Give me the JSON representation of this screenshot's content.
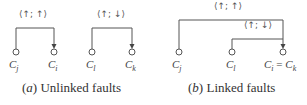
{
  "panels": [
    {
      "caption_letter": "a",
      "caption_text": "Unlinked faults",
      "groups": [
        {
          "tag": "⟨↑; ↑⟩",
          "from": "C_j",
          "to": "C_i"
        },
        {
          "tag": "⟨↑; ↓⟩",
          "from": "C_l",
          "to": "C_k"
        }
      ]
    },
    {
      "caption_letter": "b",
      "caption_text": "Linked faults",
      "groups": [
        {
          "tag": "⟨↑; ↑⟩",
          "from": "C_j",
          "to": "C_i = C_k"
        },
        {
          "tag": "⟨↑; ↓⟩",
          "from": "C_l",
          "to": "C_i = C_k"
        }
      ]
    }
  ],
  "labels": {
    "a_j": "C",
    "a_j_sub": "j",
    "a_i": "C",
    "a_i_sub": "i",
    "a_l": "C",
    "a_l_sub": "l",
    "a_k": "C",
    "a_k_sub": "k",
    "b_j": "C",
    "b_j_sub": "j",
    "b_l": "C",
    "b_l_sub": "l",
    "b_ik_1": "C",
    "b_ik_1_sub": "i",
    "b_ik_eq": " = ",
    "b_ik_2": "C",
    "b_ik_2_sub": "k"
  },
  "tags": {
    "a1": "⟨↑; ↑⟩",
    "a2": "⟨↑; ↓⟩",
    "b1": "⟨↑; ↑⟩",
    "b2": "⟨↑; ↓⟩"
  },
  "captions": {
    "a_open": "(",
    "a_letter": "a",
    "a_close": ") ",
    "a_text": "Unlinked faults",
    "b_open": "(",
    "b_letter": "b",
    "b_close": ") ",
    "b_text": "Linked faults"
  }
}
